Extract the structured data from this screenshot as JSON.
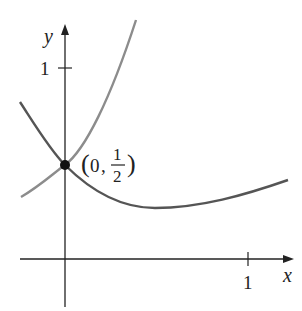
{
  "figure": {
    "axes": {
      "x_label": "x",
      "y_label": "y",
      "x_tick_label": "1",
      "y_tick_label": "1"
    },
    "point": {
      "label_x": "0",
      "label_num": "1",
      "label_den": "2",
      "x": 0,
      "y": 0.5
    },
    "curves": [
      {
        "name": "increasing-curve",
        "color": "#8c8c8c"
      },
      {
        "name": "decreasing-curve",
        "color": "#555555"
      }
    ]
  }
}
